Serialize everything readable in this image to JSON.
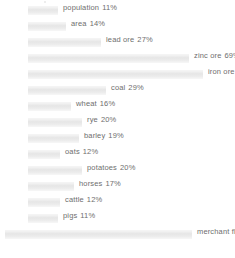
{
  "chart_data": {
    "type": "bar",
    "orientation": "horizontal",
    "title": "",
    "subtitle": "",
    "xlabel": "",
    "ylabel": "",
    "xlim": [
      0,
      100
    ],
    "grid": false,
    "legend": false,
    "unit": "%",
    "categories": [
      "population",
      "area",
      "lead ore",
      "zinc ore",
      "iron ore",
      "coal",
      "wheat",
      "rye",
      "barley",
      "oats",
      "potatoes",
      "horses",
      "cattle",
      "pigs",
      "merchant fleet"
    ],
    "values": [
      11,
      14,
      27,
      69,
      75,
      29,
      16,
      20,
      19,
      12,
      20,
      17,
      12,
      11,
      90
    ],
    "labels": [
      "population  11%",
      "area  14%",
      "lead ore  27%",
      "zinc ore  69%",
      "iron ore  75%",
      "coal  29%",
      "wheat  16%",
      "rye  20%",
      "barley  19%",
      "oats  12%",
      "potatoes  20%",
      "horses  17%",
      "cattle  12%",
      "pigs  11%",
      "merchant fleet  90%"
    ],
    "rows": [
      {
        "name": "population",
        "value": 11,
        "value_text": "11%",
        "bar_px": 30
      },
      {
        "name": "area",
        "value": 14,
        "value_text": "14%",
        "bar_px": 38
      },
      {
        "name": "lead ore",
        "value": 27,
        "value_text": "27%",
        "bar_px": 73
      },
      {
        "name": "zinc ore",
        "value": 69,
        "value_text": "69%",
        "bar_px": 161
      },
      {
        "name": "iron ore",
        "value": 75,
        "value_text": "75%",
        "bar_px": 175
      },
      {
        "name": "coal",
        "value": 29,
        "value_text": "29%",
        "bar_px": 78
      },
      {
        "name": "wheat",
        "value": 16,
        "value_text": "16%",
        "bar_px": 43
      },
      {
        "name": "rye",
        "value": 20,
        "value_text": "20%",
        "bar_px": 54
      },
      {
        "name": "barley",
        "value": 19,
        "value_text": "19%",
        "bar_px": 51
      },
      {
        "name": "oats",
        "value": 12,
        "value_text": "12%",
        "bar_px": 32
      },
      {
        "name": "potatoes",
        "value": 20,
        "value_text": "20%",
        "bar_px": 54
      },
      {
        "name": "horses",
        "value": 17,
        "value_text": "17%",
        "bar_px": 46
      },
      {
        "name": "cattle",
        "value": 12,
        "value_text": "12%",
        "bar_px": 32
      },
      {
        "name": "pigs",
        "value": 11,
        "value_text": "11%",
        "bar_px": 30
      },
      {
        "name": "merchant fleet",
        "value": 90,
        "value_text": "90%",
        "bar_px": 187,
        "wide": true
      }
    ]
  },
  "style": {
    "bar_color": "#e8e8e8",
    "bar_highlight": "#f5f5f5",
    "text_color": "#6e6e6e",
    "background": "#ffffff"
  }
}
